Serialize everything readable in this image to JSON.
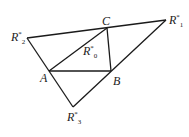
{
  "diagram": {
    "title": "",
    "points": {
      "R2": {
        "label": "R",
        "sup": "*",
        "sub": "2",
        "x": 27,
        "y": 38
      },
      "C": {
        "label": "C",
        "x": 107,
        "y": 28
      },
      "R1": {
        "label": "R",
        "sup": "*",
        "sub": "1",
        "x": 166,
        "y": 20
      },
      "A": {
        "label": "A",
        "x": 49,
        "y": 71
      },
      "B": {
        "label": "B",
        "x": 111,
        "y": 71
      },
      "R3": {
        "label": "R",
        "sup": "*",
        "sub": "3",
        "x": 73,
        "y": 107
      },
      "R0": {
        "label": "R",
        "sup": "*",
        "sub": "0"
      }
    },
    "stroke_color": "#1a1a1a"
  }
}
